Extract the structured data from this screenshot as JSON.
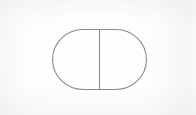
{
  "image": {
    "kind": "scanned-line-drawing",
    "width": 196,
    "height": 115,
    "background_color": "#fdfdfd",
    "paper_tone": "off-white scanned paper with faint gray edge shading",
    "caption": "",
    "labels": []
  },
  "figure": {
    "name": "divided-capsule",
    "stroke_color": "#8a8a8a",
    "stroke_width": 1,
    "fill_color": "#fefefe",
    "bounds": {
      "x": 52,
      "y": 29,
      "width": 95,
      "height": 61
    },
    "corner_radius": 30.5,
    "parts": [
      {
        "name": "capsule-outline",
        "type": "stadium",
        "left": 52,
        "top": 29,
        "right": 147,
        "bottom": 90
      },
      {
        "name": "vertical-divider",
        "type": "line",
        "x": 99.5,
        "y_top": 29,
        "y_bottom": 90
      }
    ],
    "regions": [
      {
        "name": "left-region",
        "label": ""
      },
      {
        "name": "right-region",
        "label": ""
      }
    ]
  }
}
